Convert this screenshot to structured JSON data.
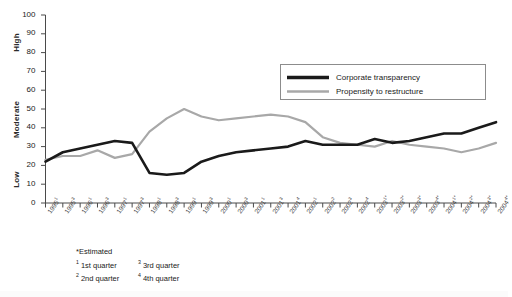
{
  "chart_data": {
    "type": "line",
    "title": "",
    "xlabel": "",
    "ylabel": "",
    "ylim": [
      0,
      100
    ],
    "yticks": [
      0,
      10,
      20,
      30,
      40,
      50,
      60,
      70,
      80,
      90,
      100
    ],
    "y_category_labels": [
      "Low",
      "Moderate",
      "High"
    ],
    "grid": false,
    "legend_position": "upper-right",
    "categories": [
      "1995¹",
      "1995³",
      "1996¹",
      "1996³",
      "1997¹",
      "1997³",
      "1998¹",
      "1998³",
      "1999¹",
      "1999³",
      "2000¹",
      "2000³",
      "2001¹",
      "2001³",
      "2001⁴",
      "2002¹",
      "2002²",
      "2002³",
      "2002⁴",
      "2003¹*",
      "2003²*",
      "2003³*",
      "2003⁴*",
      "2004¹*",
      "2004²*",
      "2004³*",
      "2004⁴*"
    ],
    "series": [
      {
        "name": "Corporate transparency",
        "color": "#1a1a1a",
        "values": [
          22,
          27,
          29,
          31,
          33,
          32,
          16,
          15,
          16,
          22,
          25,
          27,
          28,
          29,
          30,
          33,
          31,
          31,
          31,
          34,
          32,
          33,
          35,
          37,
          37,
          40,
          43
        ]
      },
      {
        "name": "Propensity to restructure",
        "color": "#a8a8a8",
        "values": [
          23,
          25,
          25,
          28,
          24,
          26,
          38,
          45,
          50,
          46,
          44,
          45,
          46,
          47,
          46,
          43,
          35,
          32,
          31,
          30,
          33,
          31,
          30,
          29,
          27,
          29,
          32
        ]
      }
    ]
  },
  "legend": {
    "items": [
      {
        "label": "Corporate transparency",
        "color": "#1a1a1a",
        "thickness": 3
      },
      {
        "label": "Propensity to restructure",
        "color": "#a8a8a8",
        "thickness": 2.4
      }
    ]
  },
  "footnotes": {
    "estimated": "*Estimated",
    "items": [
      {
        "marker": "1",
        "text": "1st quarter"
      },
      {
        "marker": "3",
        "text": "3rd quarter"
      },
      {
        "marker": "2",
        "text": "2nd quarter"
      },
      {
        "marker": "4",
        "text": "4th quarter"
      }
    ]
  }
}
